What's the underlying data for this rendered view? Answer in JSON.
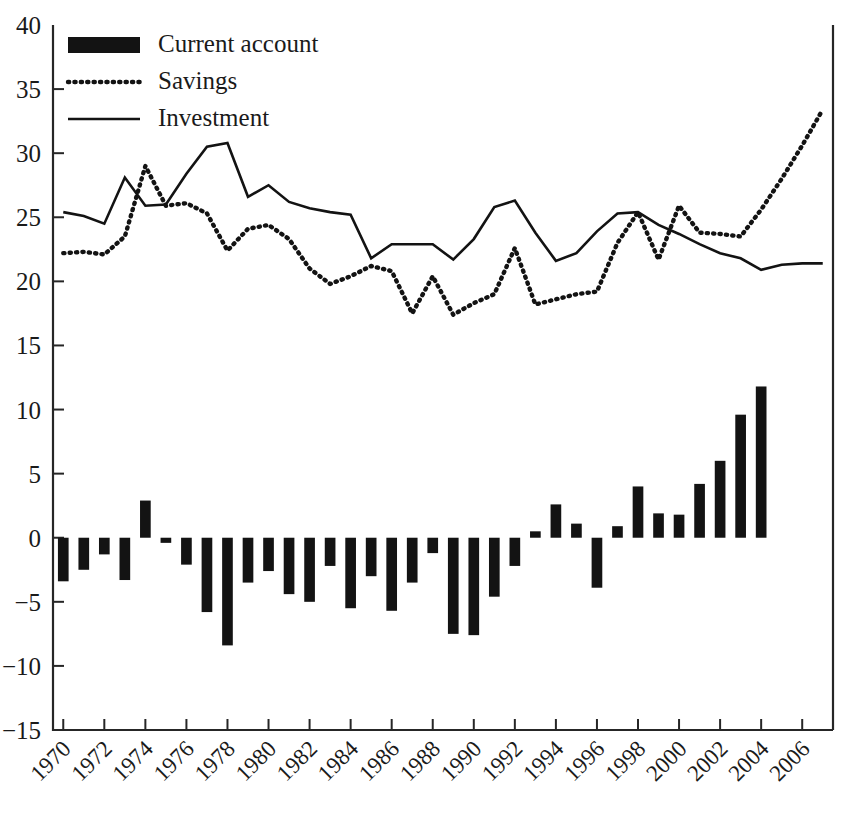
{
  "chart_data": {
    "type": "bar",
    "title": "",
    "subtitle": "",
    "xlabel": "",
    "ylabel": "",
    "xlim": [
      1970,
      2007
    ],
    "ylim": [
      -15,
      40
    ],
    "yticks": [
      -15,
      -10,
      -5,
      0,
      5,
      10,
      15,
      20,
      25,
      30,
      35,
      40
    ],
    "ytick_labels": [
      "−15",
      "−10",
      "−5",
      "0",
      "5",
      "10",
      "15",
      "20",
      "25",
      "30",
      "35",
      "40"
    ],
    "xticks": [
      1970,
      1972,
      1974,
      1976,
      1978,
      1980,
      1982,
      1984,
      1986,
      1988,
      1990,
      1992,
      1994,
      1996,
      1998,
      2000,
      2002,
      2004,
      2006
    ],
    "xtick_labels": [
      "1970",
      "1972",
      "1974",
      "1976",
      "1978",
      "1980",
      "1982",
      "1984",
      "1986",
      "1988",
      "1990",
      "1992",
      "1994",
      "1996",
      "1998",
      "2000",
      "2002",
      "2004",
      "2006"
    ],
    "xtick_rotation": 45,
    "grid": false,
    "legend_position": "top-left",
    "x": [
      1970,
      1971,
      1972,
      1973,
      1974,
      1975,
      1976,
      1977,
      1978,
      1979,
      1980,
      1981,
      1982,
      1983,
      1984,
      1985,
      1986,
      1987,
      1988,
      1989,
      1990,
      1991,
      1992,
      1993,
      1994,
      1995,
      1996,
      1997,
      1998,
      1999,
      2000,
      2001,
      2002,
      2003,
      2004,
      2005,
      2006,
      2007
    ],
    "series": [
      {
        "name": "Current account",
        "type": "bar",
        "color": "#131313",
        "values": [
          -3.4,
          -2.5,
          -1.3,
          -3.3,
          2.9,
          -0.4,
          -2.1,
          -5.8,
          -8.4,
          -3.5,
          -2.6,
          -4.4,
          -5.0,
          -2.2,
          -5.5,
          -3.0,
          -5.7,
          -3.5,
          -1.2,
          -7.5,
          -7.6,
          -4.6,
          -2.2,
          0.5,
          2.6,
          1.1,
          -3.9,
          0.9,
          4.0,
          1.9,
          1.8,
          4.2,
          6.0,
          9.6,
          11.8,
          null,
          null,
          null
        ]
      },
      {
        "name": "Savings",
        "type": "line",
        "style": "dotted",
        "color": "#131313",
        "values": [
          22.2,
          22.3,
          22.1,
          23.5,
          29.0,
          25.9,
          26.1,
          25.3,
          22.4,
          24.1,
          24.4,
          23.3,
          21.0,
          19.8,
          20.4,
          21.2,
          20.8,
          17.5,
          20.4,
          17.4,
          18.3,
          19.0,
          22.6,
          18.2,
          18.6,
          19.0,
          19.2,
          23.0,
          25.4,
          21.7,
          25.9,
          23.8,
          23.7,
          23.5,
          25.6,
          28.0,
          30.6,
          33.4
        ]
      },
      {
        "name": "Investment",
        "type": "line",
        "style": "solid",
        "color": "#131313",
        "values": [
          25.4,
          25.1,
          24.5,
          28.1,
          25.9,
          26.0,
          28.4,
          30.5,
          30.8,
          26.6,
          27.5,
          26.2,
          25.7,
          25.4,
          25.2,
          21.8,
          22.9,
          22.9,
          22.9,
          21.7,
          23.3,
          25.8,
          26.3,
          23.8,
          21.6,
          22.2,
          23.9,
          25.3,
          25.4,
          24.4,
          23.7,
          22.9,
          22.2,
          21.8,
          20.9,
          21.3,
          21.4,
          21.4
        ]
      }
    ]
  },
  "legend": {
    "items": [
      {
        "label": "Current account",
        "marker": "filled-bar-swatch"
      },
      {
        "label": "Savings",
        "marker": "dotted-line-swatch"
      },
      {
        "label": "Investment",
        "marker": "solid-line-swatch"
      }
    ]
  },
  "colors": {
    "ink": "#131313",
    "axis": "#262626",
    "background": "#ffffff"
  }
}
